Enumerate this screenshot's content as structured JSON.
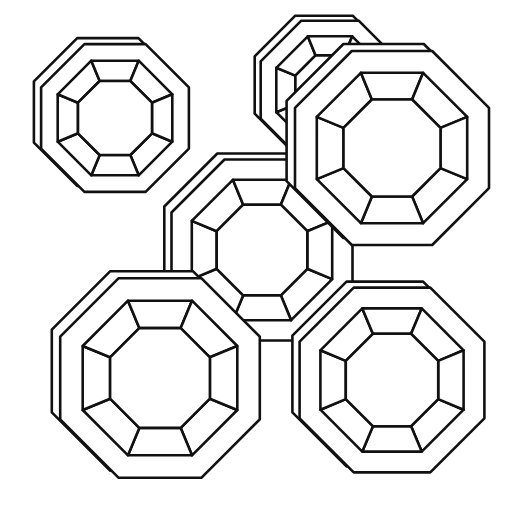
{
  "diagram": {
    "colors": {
      "background": "#ffffff",
      "line": "#111111"
    },
    "cages": [
      {
        "name": "cage-top-left",
        "cx": 115,
        "cy": 118,
        "r": 80,
        "depth": 12
      },
      {
        "name": "cage-top-back",
        "cx": 330,
        "cy": 90,
        "r": 75,
        "depth": 10
      },
      {
        "name": "cage-center",
        "cx": 262,
        "cy": 250,
        "r": 98,
        "depth": 12
      },
      {
        "name": "cage-top-right",
        "cx": 392,
        "cy": 148,
        "r": 105,
        "depth": 14
      },
      {
        "name": "cage-bottom-left",
        "cx": 160,
        "cy": 378,
        "r": 108,
        "depth": 14
      },
      {
        "name": "cage-bottom-right",
        "cx": 392,
        "cy": 380,
        "r": 100,
        "depth": 12
      }
    ]
  }
}
